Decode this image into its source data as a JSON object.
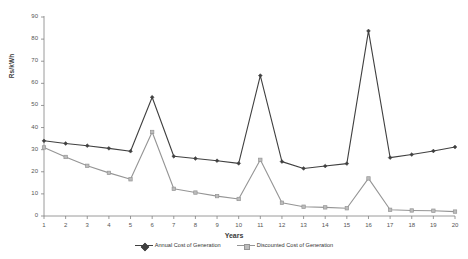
{
  "chart_data": {
    "type": "line",
    "title": "",
    "subtitle": "",
    "xlabel": "Years",
    "ylabel": "Rs/kWh",
    "xlim": [
      1,
      20
    ],
    "ylim": [
      0,
      90
    ],
    "ytick_step": 10,
    "grid": false,
    "legend_position": "bottom",
    "categories": [
      1,
      2,
      3,
      4,
      5,
      6,
      7,
      8,
      9,
      10,
      11,
      12,
      13,
      14,
      15,
      16,
      17,
      18,
      19,
      20
    ],
    "xtick_labels": [
      "1",
      "2",
      "3",
      "4",
      "5",
      "6",
      "7",
      "8",
      "9",
      "10",
      "11",
      "12",
      "13",
      "14",
      "15",
      "16",
      "17",
      "18",
      "19",
      "20"
    ],
    "ytick_labels": [
      "0",
      "10",
      "20",
      "30",
      "40",
      "50",
      "60",
      "70",
      "80",
      "90"
    ],
    "series": [
      {
        "name": "Annual Cost of Generation",
        "color": "#404040",
        "marker": "diamond",
        "values": [
          34,
          32.8,
          31.8,
          30.6,
          29.3,
          53.7,
          27.0,
          26.0,
          25.0,
          23.8,
          63.5,
          24.6,
          21.5,
          22.6,
          23.7,
          83.7,
          26.4,
          27.8,
          29.4,
          31.2
        ]
      },
      {
        "name": "Discounted Cost of Generation",
        "color": "#959595",
        "marker": "square",
        "values": [
          31.0,
          26.7,
          22.7,
          19.5,
          16.6,
          38.0,
          12.3,
          10.6,
          9.0,
          7.7,
          25.4,
          6.0,
          4.2,
          3.9,
          3.5,
          17.0,
          2.8,
          2.5,
          2.4,
          2.0
        ]
      }
    ]
  },
  "axes": {
    "y_title": "Rs/kWh",
    "x_title": "Years"
  },
  "legend": {
    "items": [
      {
        "label": "Annual Cost of Generation",
        "color": "#404040",
        "marker": "diamond"
      },
      {
        "label": "Discounted Cost of Generation",
        "color": "#959595",
        "marker": "square"
      }
    ]
  },
  "colors": {
    "background": "#ffffff",
    "axis": "#808080",
    "series_annual": "#404040",
    "series_discounted": "#959595"
  }
}
